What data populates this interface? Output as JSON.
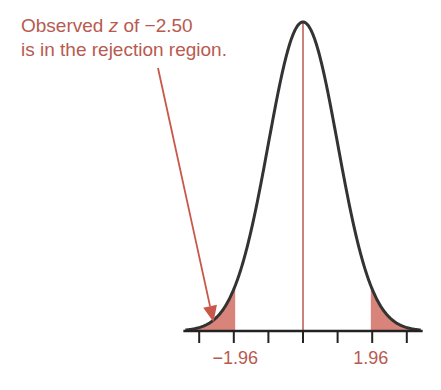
{
  "chart_data": {
    "type": "area",
    "title": "",
    "xlabel": "",
    "ylabel": "",
    "xlim": [
      -3.4,
      3.4
    ],
    "x_ticks": [
      -3,
      -2,
      -1,
      0,
      1,
      2,
      3
    ],
    "tick_labels": [
      {
        "value": -1.96,
        "label": "−1.96"
      },
      {
        "value": 1.96,
        "label": "1.96"
      }
    ],
    "critical_values": [
      -1.96,
      1.96
    ],
    "shaded_regions": [
      {
        "from": -3.4,
        "to": -1.96,
        "label": "left rejection region"
      },
      {
        "from": 1.96,
        "to": 3.4,
        "label": "right rejection region"
      }
    ],
    "center_line": 0,
    "observed_z": -2.5,
    "annotation": {
      "line1_prefix": "Observed ",
      "line1_var": "z",
      "line1_suffix": " of −2.50",
      "line2": "is in the rejection region."
    },
    "grid": false,
    "legend": "none",
    "colors": {
      "curve": "#333333",
      "shade": "#d9847a",
      "accent": "#b85a50",
      "axis": "#222222"
    }
  }
}
